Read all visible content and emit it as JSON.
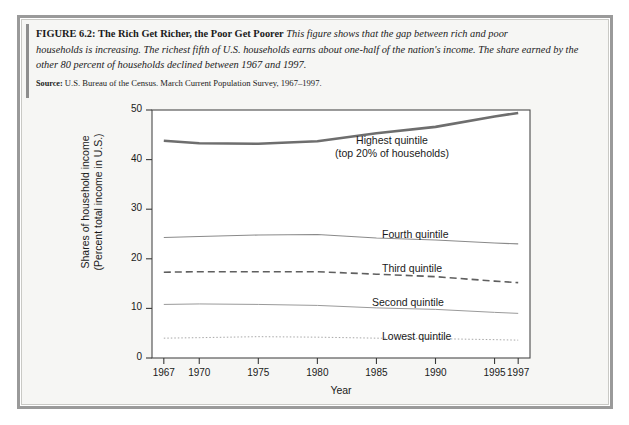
{
  "figure": {
    "number": "FIGURE 6.2:",
    "title": "The Rich Get Richer, the Poor Get Poorer",
    "caption_line1": "This figure shows that the gap between rich and poor",
    "caption_line2": "households is increasing. The richest fifth of U.S. households earns about one-half of the nation's income. The share earned by the",
    "caption_line3": "other 80 percent of households declined between 1967 and 1997.",
    "source_label": "Source:",
    "source_text": "U.S. Bureau of the Census. March Current Population Survey, 1967–1997."
  },
  "chart_data": {
    "type": "line",
    "title": "",
    "xlabel": "Year",
    "ylabel_line1": "Shares of household income",
    "ylabel_line2": "(Percent total income in U.S.)",
    "xlim": [
      1966,
      1998
    ],
    "ylim": [
      0,
      50
    ],
    "xticks": [
      1967,
      1970,
      1975,
      1980,
      1985,
      1990,
      1995,
      1997
    ],
    "xtick_labels": [
      "1967",
      "1970",
      "1975",
      "1980",
      "1985",
      "1990",
      "1995",
      "1997"
    ],
    "yticks": [
      0,
      10,
      20,
      30,
      40,
      50
    ],
    "ytick_labels": [
      "0",
      "10",
      "20",
      "30",
      "40",
      "50"
    ],
    "grid": false,
    "legend": "inline-labels",
    "x": [
      1967,
      1970,
      1975,
      1980,
      1985,
      1990,
      1995,
      1997
    ],
    "series": [
      {
        "name": "Highest quintile",
        "label_line1": "Highest quintile",
        "label_line2": "(top 20% of households)",
        "style": "solid-thick",
        "color": "#6e6e6e",
        "width": 2.6,
        "values": [
          43.8,
          43.3,
          43.2,
          43.7,
          45.3,
          46.6,
          48.7,
          49.4
        ]
      },
      {
        "name": "Fourth quintile",
        "label_line1": "Fourth quintile",
        "style": "solid-thin",
        "color": "#8a8a8a",
        "width": 1.1,
        "values": [
          24.3,
          24.5,
          24.8,
          24.9,
          24.2,
          23.8,
          23.2,
          23.0
        ]
      },
      {
        "name": "Third quintile",
        "label_line1": "Third quintile",
        "style": "dashed",
        "color": "#5f5f5f",
        "width": 1.6,
        "values": [
          17.3,
          17.4,
          17.4,
          17.4,
          16.9,
          16.4,
          15.5,
          15.2
        ]
      },
      {
        "name": "Second quintile",
        "label_line1": "Second quintile",
        "style": "solid-thin",
        "color": "#9a9a9a",
        "width": 1.0,
        "values": [
          10.8,
          10.9,
          10.8,
          10.6,
          10.1,
          9.8,
          9.2,
          9.0
        ]
      },
      {
        "name": "Lowest quintile",
        "label_line1": "Lowest quintile",
        "style": "dotted",
        "color": "#a8a8a8",
        "width": 1.0,
        "values": [
          4.0,
          4.1,
          4.3,
          4.2,
          4.0,
          3.9,
          3.7,
          3.6
        ]
      }
    ]
  }
}
